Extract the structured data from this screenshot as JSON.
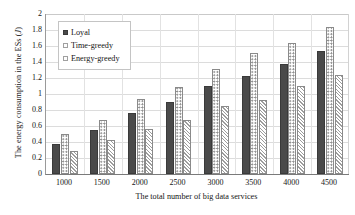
{
  "chart_data": {
    "type": "bar",
    "title": "",
    "xlabel": "The total number of big data services",
    "ylabel": "The energy consumption in the ESs (J)",
    "categories": [
      "1000",
      "1500",
      "2000",
      "2500",
      "3000",
      "3500",
      "4000",
      "4500"
    ],
    "series": [
      {
        "name": "Loyal",
        "values": [
          0.37,
          0.55,
          0.76,
          0.9,
          1.1,
          1.23,
          1.38,
          1.54
        ]
      },
      {
        "name": "Time-greedy",
        "values": [
          0.5,
          0.68,
          0.94,
          1.09,
          1.31,
          1.51,
          1.64,
          1.84
        ]
      },
      {
        "name": "Energy-greedy",
        "values": [
          0.29,
          0.43,
          0.56,
          0.68,
          0.85,
          0.93,
          1.1,
          1.24
        ]
      }
    ],
    "ylim": [
      0,
      2
    ],
    "ytick_labels": [
      "0",
      "0.2",
      "0.4",
      "0.6",
      "0.8",
      "1",
      "1.2",
      "1.4",
      "1.6",
      "1.8",
      "2"
    ],
    "ytick_values": [
      0,
      0.2,
      0.4,
      0.6,
      0.8,
      1.0,
      1.2,
      1.4,
      1.6,
      1.8,
      2.0
    ],
    "grid": true,
    "legend_position": "upper-left",
    "colors": {
      "loyal": "#4a4a4a",
      "time_greedy": "#ffffff",
      "energy_greedy": "#ffffff",
      "gridline": "#dcdcdc",
      "axis": "#7a7a7a",
      "text": "#141414"
    }
  },
  "axes": {
    "y_title_main": "The energy consumption in the ESs (",
    "y_title_unit": "J",
    "y_title_close": ")",
    "x_title": "The total number of big data services"
  },
  "legend": {
    "items": [
      {
        "label": "Loyal"
      },
      {
        "label": "Time-greedy"
      },
      {
        "label": "Energy-greedy"
      }
    ]
  }
}
